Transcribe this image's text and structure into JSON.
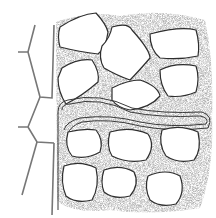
{
  "diagram": {
    "type": "cell-wall illustration",
    "colors": {
      "background": "#ffffff",
      "outline": "#333333",
      "stipple": "#9a9a9a",
      "wall_line": "#666666"
    },
    "elements": [
      {
        "name": "cell-cluster-upper",
        "count": 7
      },
      {
        "name": "cell-cluster-lower",
        "count": 7
      },
      {
        "name": "intercellular-channel",
        "orientation": "horizontal-sinuous"
      },
      {
        "name": "adjoining-tissue-walls",
        "side": "left"
      }
    ]
  }
}
